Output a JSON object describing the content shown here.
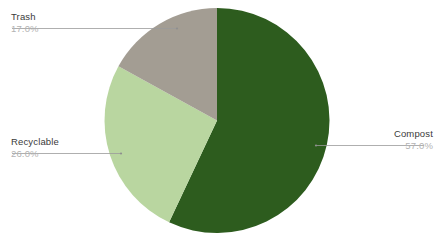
{
  "chart_data": {
    "type": "pie",
    "title": "",
    "categories": [
      "Compost",
      "Recyclable",
      "Trash"
    ],
    "values": [
      57.0,
      26.0,
      17.0
    ],
    "value_labels": [
      "57.0%",
      "26.0%",
      "17.0%"
    ],
    "colors": [
      "#2d5c1e",
      "#b9d6a0",
      "#a39d93"
    ],
    "start_angle_deg": 0,
    "direction": "clockwise",
    "legend": "none",
    "labels_position": "outside-with-leader-lines",
    "total": 100.0,
    "units": "percent",
    "slices": [
      {
        "name": "Compost",
        "value": 57.0,
        "value_label": "57.0%",
        "color": "#2d5c1e",
        "start_deg": 0,
        "end_deg": 205.2
      },
      {
        "name": "Recyclable",
        "value": 26.0,
        "value_label": "26.0%",
        "color": "#b9d6a0",
        "start_deg": 205.2,
        "end_deg": 298.8
      },
      {
        "name": "Trash",
        "value": 17.0,
        "value_label": "17.0%",
        "color": "#a39d93",
        "start_deg": 298.8,
        "end_deg": 360
      }
    ]
  },
  "callouts": {
    "trash": {
      "name": "Trash",
      "value": "17.0%"
    },
    "recyclable": {
      "name": "Recyclable",
      "value": "26.0%"
    },
    "compost": {
      "name": "Compost",
      "value": "57.0%"
    }
  },
  "canvas": {
    "background": "#ffffff",
    "leader_line_color": "#9a9a9a"
  }
}
